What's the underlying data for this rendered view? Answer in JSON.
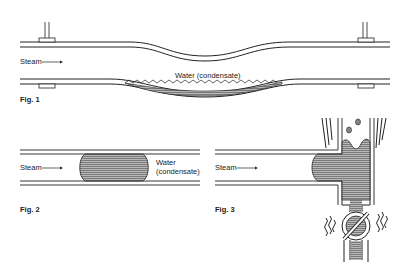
{
  "figures": [
    {
      "id": "fig1",
      "caption": "Fig. 1",
      "labels": {
        "steam": "Steam",
        "water": "Water (condensate)"
      }
    },
    {
      "id": "fig2",
      "caption": "Fig. 2",
      "labels": {
        "steam": "Steam",
        "water_line1": "Water",
        "water_line2": "(condensate)"
      }
    },
    {
      "id": "fig3",
      "caption": "Fig. 3",
      "labels": {
        "steam": "Steam"
      }
    }
  ],
  "colors": {
    "line": "#222222",
    "water_fill": "#9a9a9a",
    "background": "#ffffff"
  }
}
